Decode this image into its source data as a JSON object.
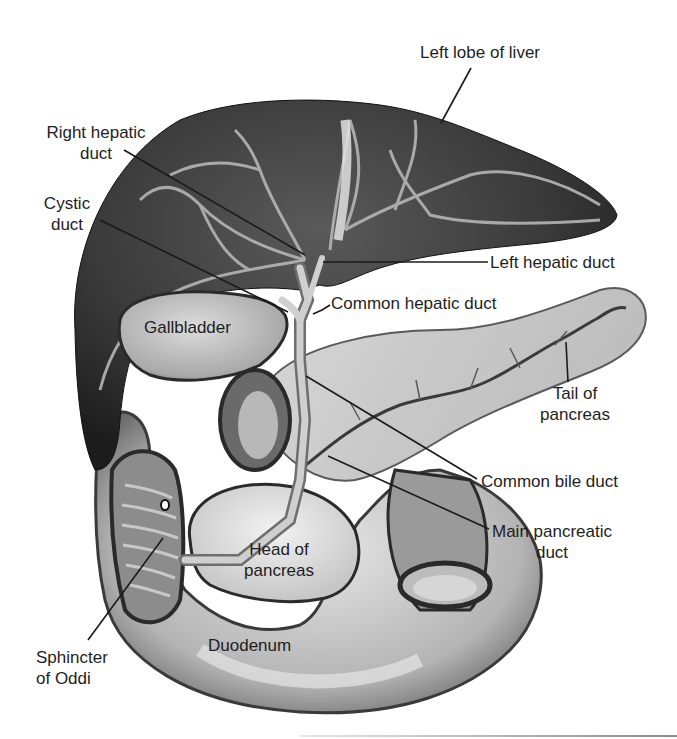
{
  "figure": {
    "style": "grayscale illustration with leader-line labels",
    "colors": {
      "background": "#ffffff",
      "liver_dark": "#2e2e2e",
      "liver_mid": "#4a4a4a",
      "vessel_light": "#b5b5b5",
      "pancreas": "#cfcfcf",
      "duodenum": "#c4c4c4",
      "label_text": "#1e1e1e",
      "leader_line": "#1a1a1a"
    }
  },
  "labels": {
    "left_lobe_of_liver": "Left lobe of liver",
    "right_hepatic_duct_l1": "Right hepatic",
    "right_hepatic_duct_l2": "duct",
    "cystic_duct_l1": "Cystic",
    "cystic_duct_l2": "duct",
    "left_hepatic_duct": "Left hepatic duct",
    "common_hepatic_duct": "Common hepatic duct",
    "gallbladder": "Gallbladder",
    "tail_of_pancreas_l1": "Tail of",
    "tail_of_pancreas_l2": "pancreas",
    "common_bile_duct": "Common bile duct",
    "main_pancreatic_duct_l1": "Main pancreatic",
    "main_pancreatic_duct_l2": "duct",
    "head_of_pancreas_l1": "Head of",
    "head_of_pancreas_l2": "pancreas",
    "duodenum": "Duodenum",
    "sphincter_of_oddi_l1": "Sphincter",
    "sphincter_of_oddi_l2": "of Oddi"
  }
}
